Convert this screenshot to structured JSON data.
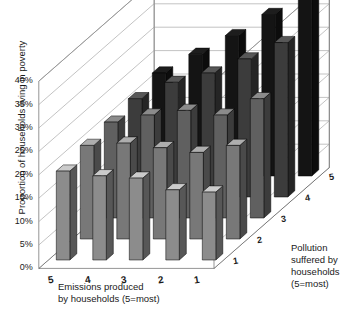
{
  "chart_data": {
    "type": "bar",
    "title": "",
    "subtitle": "",
    "ylabel": "Proportion of households living in poverty",
    "xlabel": "Emissions produced\nby households (5=most)",
    "zlabel": "Pollution\nsuffered by\nhouseholds\n(5=most)",
    "xlabel_line1": "Emissions produced",
    "xlabel_line2": "by households (5=most)",
    "zlabel_line1": "Pollution",
    "zlabel_line2": "suffered by",
    "zlabel_line3": "households",
    "zlabel_line4": "(5=most)",
    "ylim": [
      0,
      40
    ],
    "ytick_values": [
      0,
      5,
      10,
      15,
      20,
      25,
      30,
      35,
      40
    ],
    "ytick_labels": [
      "0%",
      "5%",
      "10%",
      "15%",
      "20%",
      "25%",
      "30%",
      "35%",
      "40%"
    ],
    "categories": [
      "5",
      "4",
      "3",
      "2",
      "1"
    ],
    "xtick_labels": [
      "5",
      "4",
      "3",
      "2",
      "1"
    ],
    "ztick_labels": [
      "1",
      "2",
      "3",
      "4",
      "5"
    ],
    "grid": true,
    "legend": "none",
    "series": [
      {
        "name": "1",
        "color": "#8c8c8c",
        "values": [
          19.0,
          18.0,
          17.5,
          15.0,
          14.5
        ]
      },
      {
        "name": "2",
        "color": "#787878",
        "values": [
          20.0,
          20.5,
          19.5,
          18.5,
          20.0
        ]
      },
      {
        "name": "3",
        "color": "#606060",
        "values": [
          20.5,
          22.0,
          23.0,
          22.0,
          25.5
        ]
      },
      {
        "name": "4",
        "color": "#3c3c3c",
        "values": [
          21.0,
          24.5,
          26.5,
          29.5,
          33.0
        ]
      },
      {
        "name": "5",
        "color": "#141414",
        "values": [
          22.0,
          26.0,
          30.0,
          34.5,
          45.0
        ]
      }
    ]
  },
  "geometry": {
    "origin_x": 63,
    "origin_y": 260,
    "x_step": 36.5,
    "z_step_x": 24.0,
    "z_step_y": -21.0,
    "unit_px": 4.68,
    "bar_w": 13.5,
    "bar_depth_x": 7.0,
    "bar_depth_y": -6.2
  }
}
